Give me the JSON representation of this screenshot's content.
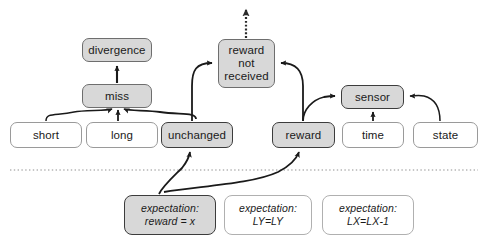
{
  "diagram": {
    "colors": {
      "filled_node_bg": "#d8d8d8",
      "plain_node_bg": "#ffffff",
      "strong_border": "#3c3c3c",
      "soft_border": "#9a9a9a",
      "edge_stroke": "#1a1a1a",
      "divider": "#9a9a9a",
      "background": "#ffffff"
    },
    "divider": {
      "name": "dotted-separator",
      "style": "dotted",
      "y": 170,
      "x_start": 10,
      "x_end": 478
    },
    "nodes": [
      {
        "id": "divergence",
        "label": "divergence",
        "style": "filled-soft",
        "x": 82,
        "y": 38,
        "w": 70,
        "h": 24
      },
      {
        "id": "miss",
        "label": "miss",
        "style": "filled-soft",
        "x": 82,
        "y": 84,
        "w": 70,
        "h": 24
      },
      {
        "id": "short",
        "label": "short",
        "style": "plain",
        "x": 10,
        "y": 122,
        "w": 72,
        "h": 26
      },
      {
        "id": "long",
        "label": "long",
        "style": "plain",
        "x": 86,
        "y": 122,
        "w": 72,
        "h": 26
      },
      {
        "id": "unchanged",
        "label": "unchanged",
        "style": "filled",
        "x": 161,
        "y": 122,
        "w": 72,
        "h": 26
      },
      {
        "id": "reward_not_recv_1",
        "label": "reward",
        "style": "filled-soft",
        "x": 218,
        "y": 39,
        "w": 57,
        "h": 49
      },
      {
        "id": "reward_not_recv_2",
        "label": "not",
        "style": "filled-soft",
        "x": 0,
        "y": 0,
        "w": 0,
        "h": 0
      },
      {
        "id": "reward_not_recv_3",
        "label": "received",
        "style": "filled-soft",
        "x": 0,
        "y": 0,
        "w": 0,
        "h": 0
      },
      {
        "id": "sensor",
        "label": "sensor",
        "style": "filled",
        "x": 341,
        "y": 85,
        "w": 63,
        "h": 24
      },
      {
        "id": "reward",
        "label": "reward",
        "style": "filled",
        "x": 272,
        "y": 122,
        "w": 63,
        "h": 26
      },
      {
        "id": "time",
        "label": "time",
        "style": "plain",
        "x": 342,
        "y": 122,
        "w": 62,
        "h": 26
      },
      {
        "id": "state",
        "label": "state",
        "style": "plain",
        "x": 413,
        "y": 122,
        "w": 65,
        "h": 26
      },
      {
        "id": "exp_reward",
        "label_line1": "expectation:",
        "label_line2": "reward = x",
        "style": "filled",
        "x": 124,
        "y": 195,
        "w": 92,
        "h": 40
      },
      {
        "id": "exp_ly",
        "label_line1": "expectation:",
        "label_line2": "LY=LY",
        "style": "plain",
        "x": 224,
        "y": 195,
        "w": 88,
        "h": 40
      },
      {
        "id": "exp_lx",
        "label_line1": "expectation:",
        "label_line2": "LX=LX-1",
        "style": "plain",
        "x": 322,
        "y": 195,
        "w": 92,
        "h": 40
      }
    ],
    "edges": [
      {
        "id": "short-to-miss",
        "from": "short",
        "to": "miss",
        "type": "curve",
        "head": "arrow"
      },
      {
        "id": "long-to-miss",
        "from": "long",
        "to": "miss",
        "type": "straight",
        "head": "arrow"
      },
      {
        "id": "unchanged-to-miss",
        "from": "unchanged",
        "to": "miss",
        "type": "curve",
        "head": "arrow"
      },
      {
        "id": "miss-to-divergence",
        "from": "miss",
        "to": "divergence",
        "type": "straight",
        "head": "arrow"
      },
      {
        "id": "unchanged-to-rnr",
        "from": "unchanged",
        "to": "reward_not_recv",
        "type": "curve",
        "head": "arrow"
      },
      {
        "id": "reward-to-rnr",
        "from": "reward",
        "to": "reward_not_recv",
        "type": "curve",
        "head": "arrow"
      },
      {
        "id": "reward-to-sensor",
        "from": "reward",
        "to": "sensor",
        "type": "curve",
        "head": "arrow"
      },
      {
        "id": "time-to-sensor",
        "from": "time",
        "to": "sensor",
        "type": "straight",
        "head": "arrow"
      },
      {
        "id": "state-to-sensor",
        "from": "state",
        "to": "sensor",
        "type": "curve",
        "head": "arrow"
      },
      {
        "id": "rnr-output",
        "from": "reward_not_recv",
        "to": "external",
        "type": "dotted-straight",
        "head": "arrow"
      },
      {
        "id": "exp-reward-to-unchanged",
        "from": "exp_reward",
        "to": "unchanged",
        "type": "curve",
        "head": "arrow"
      },
      {
        "id": "exp-reward-to-reward",
        "from": "exp_reward",
        "to": "reward",
        "type": "curve",
        "head": "arrow"
      }
    ]
  }
}
